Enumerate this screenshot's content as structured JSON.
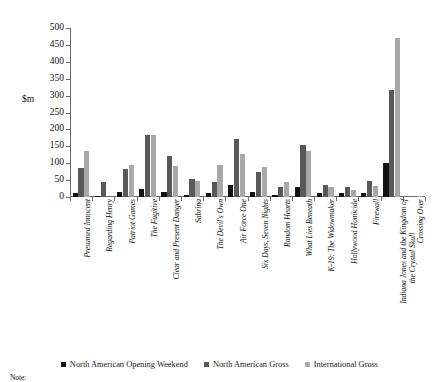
{
  "chart_data": {
    "type": "bar",
    "title": "",
    "subtitle": "",
    "xlabel": "",
    "ylabel": "$m",
    "ylim": [
      0,
      500
    ],
    "ytick_step": 50,
    "yticks": [
      0,
      50,
      100,
      150,
      200,
      250,
      300,
      350,
      400,
      450,
      500
    ],
    "grid": false,
    "legend_position": "bottom",
    "categories": [
      "Presumed Innocent",
      "Regarding Henry",
      "Patriot Games",
      "The Fugitive",
      "Clear and Present Danger",
      "Sabrina",
      "The Devil's Own",
      "Air Force One",
      "Six Days, Seven Nights",
      "Random Hearts",
      "What Lies Beneath",
      "K-19: The Widowmaker",
      "Hollywood Homicide",
      "Firewall",
      "Indiana Jones and the Kingdom of the Crystal Skull",
      "Crossing Over"
    ],
    "series": [
      {
        "name": "North American Opening Weekend",
        "color": "#111111",
        "values": [
          11,
          4,
          16,
          23,
          16,
          5,
          13,
          37,
          16,
          5,
          29,
          12,
          11,
          13,
          100,
          0
        ]
      },
      {
        "name": "North American Gross",
        "color": "#585858",
        "values": [
          86,
          43,
          83,
          184,
          122,
          53,
          43,
          173,
          74,
          31,
          155,
          35,
          30,
          48,
          317,
          0
        ]
      },
      {
        "name": "International Gross",
        "color": "#a8a8a8",
        "values": [
          135,
          0,
          95,
          184,
          93,
          47,
          96,
          127,
          90,
          43,
          136,
          31,
          22,
          34,
          469,
          2
        ]
      }
    ]
  },
  "legend": {
    "items": [
      {
        "label": "North American Opening Weekend"
      },
      {
        "label": "North American Gross"
      },
      {
        "label": "International Gross"
      }
    ]
  },
  "axis": {
    "unit_label": "$m"
  },
  "footer": {
    "note_label": "Note:"
  }
}
